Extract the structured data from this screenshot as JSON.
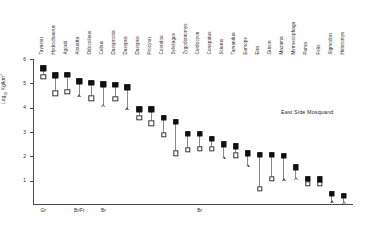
{
  "figure": {
    "annotation": "East Side Mosquand",
    "annotation_x": 281,
    "annotation_y": 110
  },
  "chart_data": {
    "type": "scatter",
    "title": "",
    "subtitle": "",
    "xlabel": "",
    "ylabel": "Log10 Kg/km2",
    "ylabel_display": "Log",
    "ylabel_sub": "10",
    "ylabel_rest": " Kg/km",
    "ylabel_sup": "2",
    "ylim": [
      0,
      6
    ],
    "yticks": [
      1,
      2,
      3,
      4,
      5,
      6
    ],
    "ytick_labels": [
      "1",
      "2",
      "3",
      "4",
      "5",
      "6"
    ],
    "grid": false,
    "legend_position": "none",
    "categories": [
      "Tayassu",
      "Hydrochaerus",
      "Agouti",
      "Alouatta",
      "Odocoileus",
      "Cebus",
      "Dasyprocta",
      "Dasypus",
      "Dasypus",
      "Procyon",
      "Coendou",
      "Sylvilagus",
      "Zygodontomys",
      "Cerdocyon",
      "Conepatus",
      "Sciurus",
      "Tamandua",
      "Eumops",
      "Eira",
      "Grison",
      "Mazama",
      "Myrmecophaga",
      "Puma",
      "Felis",
      "Sigmodon",
      "Heteromys"
    ],
    "series": [
      {
        "name": "upper-value",
        "marker": "filled-square",
        "values": [
          5.62,
          5.33,
          5.34,
          5.08,
          5.02,
          4.96,
          4.94,
          4.83,
          3.93,
          3.93,
          3.58,
          3.43,
          2.93,
          2.92,
          2.72,
          2.5,
          2.42,
          2.12,
          2.07,
          2.06,
          2.02,
          1.55,
          1.08,
          1.06,
          0.45,
          0.38
        ]
      },
      {
        "name": "lower-value",
        "marker": "open-square-or-triangle",
        "marker_types": [
          "open-square",
          "open-square",
          "open-square",
          "open-triangle",
          "open-square",
          "open-triangle",
          "open-square",
          "open-triangle",
          "open-square",
          "open-square",
          "open-square",
          "open-square",
          "open-square",
          "open-square",
          "open-square",
          "open-triangle",
          "open-square",
          "open-triangle",
          "open-square",
          "open-square",
          "open-triangle",
          "open-triangle",
          "open-square",
          "open-square",
          "open-triangle",
          "open-triangle"
        ],
        "values": [
          5.28,
          4.59,
          4.64,
          4.48,
          4.38,
          4.08,
          4.37,
          3.95,
          3.58,
          3.35,
          2.88,
          2.12,
          2.26,
          2.3,
          2.3,
          1.95,
          2.05,
          1.62,
          0.67,
          1.07,
          1.03,
          1.1,
          0.88,
          0.86,
          0.12,
          0.1
        ]
      }
    ],
    "guild_labels": [
      {
        "text": "Gr",
        "category_index": 0
      },
      {
        "text": "Br/Fr",
        "category_index": 3
      },
      {
        "text": "Br",
        "category_index": 5
      },
      {
        "text": "Br",
        "category_index": 13
      }
    ]
  }
}
